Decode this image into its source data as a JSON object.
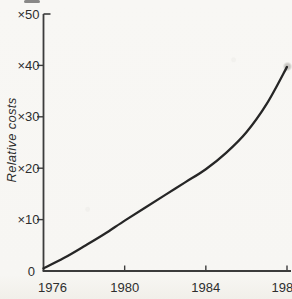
{
  "window": {
    "background": "#f8f7f4"
  },
  "chart_data": {
    "type": "line",
    "title": "",
    "xlabel": "",
    "ylabel": "Relative costs",
    "grid": false,
    "legend": null,
    "xlim": [
      1976,
      1988.2
    ],
    "ylim": [
      0,
      50
    ],
    "x_ticks": [
      {
        "label": "1976",
        "year": 1976
      },
      {
        "label": "1980",
        "year": 1980
      },
      {
        "label": "1984",
        "year": 1984
      },
      {
        "label": "1988",
        "year": 1988
      }
    ],
    "y_ticks": [
      {
        "label": "×50",
        "value": 50
      },
      {
        "label": "×40",
        "value": 40
      },
      {
        "label": "×30",
        "value": 30
      },
      {
        "label": "×20",
        "value": 20
      },
      {
        "label": "×10",
        "value": 10
      },
      {
        "label": "0",
        "value": 0
      }
    ],
    "series": [
      {
        "name": "relative costs",
        "x": [
          1976,
          1977,
          1978,
          1979,
          1980,
          1981,
          1982,
          1983,
          1984,
          1985,
          1986,
          1987,
          1988
        ],
        "values": [
          0.5,
          2.5,
          4.8,
          7.2,
          9.8,
          12.3,
          14.8,
          17.3,
          19.8,
          23.0,
          27.0,
          32.5,
          39.7
        ]
      }
    ],
    "line_color": "#262626",
    "axis_color": "#3c3c3c",
    "text_color": "#2e2e2e"
  }
}
